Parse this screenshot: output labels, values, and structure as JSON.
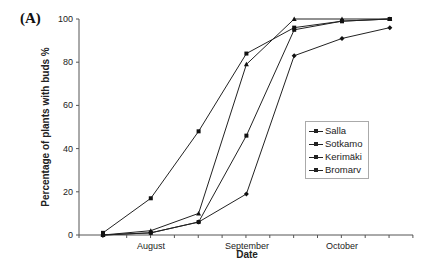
{
  "panel_label": "(A)",
  "chart_data": {
    "type": "line",
    "title": "",
    "xlabel": "Date",
    "ylabel": "Percentage of plants with buds %",
    "ylim": [
      0,
      100
    ],
    "yticks": [
      0,
      20,
      40,
      60,
      80,
      100
    ],
    "xtick_labels": [
      "August",
      "September",
      "October"
    ],
    "x_index": [
      1,
      2,
      3,
      4,
      5,
      6,
      7
    ],
    "grid": false,
    "legend_position": "center-right",
    "series": [
      {
        "name": "Salla",
        "marker": "square",
        "values": [
          1,
          17,
          48,
          84,
          96,
          99,
          100
        ]
      },
      {
        "name": "Sotkamo",
        "marker": "triangle",
        "values": [
          0,
          2,
          10,
          79,
          100,
          100,
          100
        ]
      },
      {
        "name": "Kerimäki",
        "marker": "square",
        "values": [
          0,
          1,
          6,
          46,
          95,
          99,
          100
        ]
      },
      {
        "name": "Bromarv",
        "marker": "diamond",
        "values": [
          0,
          1,
          6,
          19,
          83,
          91,
          96
        ]
      }
    ]
  },
  "legend": {
    "items": [
      "Salla",
      "Sotkamo",
      "Kerimäki",
      "Bromarv"
    ]
  },
  "axes": {
    "y_title": "Percentage of plants with buds %",
    "x_title": "Date",
    "x_labels": [
      "August",
      "September",
      "October"
    ],
    "y_labels": [
      "0",
      "20",
      "40",
      "60",
      "80",
      "100"
    ]
  }
}
